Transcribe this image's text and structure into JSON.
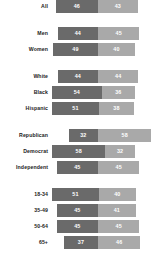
{
  "chart_data": {
    "type": "bar",
    "subtype": "diverging-stacked-bar",
    "title": "",
    "xlabel": "",
    "ylabel": "",
    "grid": false,
    "legend": "none",
    "axis_center": 50,
    "scale_max": 100,
    "colors": {
      "series_left": "#6a6a6a",
      "series_right": "#a9a9a9",
      "label_text": "#1b1b1b",
      "value_text": "#ffffff",
      "background": "#ffffff"
    },
    "series": [
      {
        "name": "left",
        "values": [
          46,
          44,
          49,
          44,
          54,
          51,
          32,
          58,
          45,
          51,
          45,
          45,
          37
        ]
      },
      {
        "name": "right",
        "values": [
          43,
          45,
          40,
          44,
          36,
          38,
          58,
          32,
          45,
          40,
          41,
          45,
          46
        ]
      }
    ],
    "categories": [
      "All",
      "Men",
      "Women",
      "White",
      "Black",
      "Hispanic",
      "Republican",
      "Democrat",
      "Independent",
      "18-34",
      "35-49",
      "50-64",
      "65+"
    ],
    "groups": [
      {
        "id": "overall",
        "gap_before": "none",
        "rows": [
          {
            "label": "All",
            "left": 46,
            "right": 43
          }
        ]
      },
      {
        "id": "gender",
        "gap_before": "large",
        "rows": [
          {
            "label": "Men",
            "left": 44,
            "right": 45
          },
          {
            "label": "Women",
            "left": 49,
            "right": 40
          }
        ]
      },
      {
        "id": "race",
        "gap_before": "large",
        "rows": [
          {
            "label": "White",
            "left": 44,
            "right": 44
          },
          {
            "label": "Black",
            "left": 54,
            "right": 36
          },
          {
            "label": "Hispanic",
            "left": 51,
            "right": 38
          }
        ]
      },
      {
        "id": "party",
        "gap_before": "large",
        "rows": [
          {
            "label": "Republican",
            "left": 32,
            "right": 58
          },
          {
            "label": "Democrat",
            "left": 58,
            "right": 32
          },
          {
            "label": "Independent",
            "left": 45,
            "right": 45
          }
        ]
      },
      {
        "id": "age",
        "gap_before": "large",
        "rows": [
          {
            "label": "18-34",
            "left": 51,
            "right": 40
          },
          {
            "label": "35-49",
            "left": 45,
            "right": 41
          },
          {
            "label": "50-64",
            "left": 45,
            "right": 45
          },
          {
            "label": "65+",
            "left": 37,
            "right": 46
          }
        ]
      }
    ]
  }
}
